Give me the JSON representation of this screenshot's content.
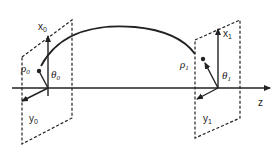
{
  "diagram": {
    "type": "coordinate-system-ray-propagation",
    "axis": {
      "label": "z"
    },
    "input_plane": {
      "x_axis_label": "x",
      "x_axis_sub": "0",
      "y_axis_label": "y",
      "y_axis_sub": "0",
      "radius_label": "ρ",
      "radius_sub": "0",
      "angle_label": "θ",
      "angle_sub": "0"
    },
    "output_plane": {
      "x_axis_label": "x",
      "x_axis_sub": "1",
      "y_axis_label": "y",
      "y_axis_sub": "1",
      "radius_label": "ρ",
      "radius_sub": "1",
      "angle_label": "θ",
      "angle_sub": "1"
    },
    "colors": {
      "ink": "#222222",
      "background": "#ffffff"
    }
  }
}
